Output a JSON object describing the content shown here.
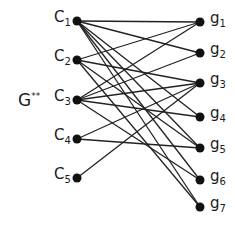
{
  "graph": {
    "title": "G",
    "title_superscript": "**",
    "left_nodes": [
      {
        "id": "c1",
        "label": "C",
        "sub": "1",
        "x": 77,
        "y": 21
      },
      {
        "id": "c2",
        "label": "C",
        "sub": "2",
        "x": 77,
        "y": 60
      },
      {
        "id": "c3",
        "label": "C",
        "sub": "3",
        "x": 77,
        "y": 100
      },
      {
        "id": "c4",
        "label": "C",
        "sub": "4",
        "x": 77,
        "y": 139
      },
      {
        "id": "c5",
        "label": "C",
        "sub": "5",
        "x": 77,
        "y": 178
      }
    ],
    "right_nodes": [
      {
        "id": "g1",
        "label": "g",
        "sub": "1",
        "x": 200,
        "y": 22
      },
      {
        "id": "g2",
        "label": "g",
        "sub": "2",
        "x": 200,
        "y": 53
      },
      {
        "id": "g3",
        "label": "g",
        "sub": "3",
        "x": 200,
        "y": 83
      },
      {
        "id": "g4",
        "label": "g",
        "sub": "4",
        "x": 200,
        "y": 117
      },
      {
        "id": "g5",
        "label": "g",
        "sub": "5",
        "x": 200,
        "y": 148
      },
      {
        "id": "g6",
        "label": "g",
        "sub": "6",
        "x": 200,
        "y": 180
      },
      {
        "id": "g7",
        "label": "g",
        "sub": "7",
        "x": 200,
        "y": 207
      }
    ],
    "edges": [
      [
        "c1",
        "g1"
      ],
      [
        "c1",
        "g2"
      ],
      [
        "c1",
        "g5"
      ],
      [
        "c1",
        "g6"
      ],
      [
        "c1",
        "g7"
      ],
      [
        "c1",
        "g4"
      ],
      [
        "c2",
        "g1"
      ],
      [
        "c2",
        "g3"
      ],
      [
        "c2",
        "g5"
      ],
      [
        "c2",
        "g7"
      ],
      [
        "c3",
        "g1"
      ],
      [
        "c3",
        "g2"
      ],
      [
        "c3",
        "g3"
      ],
      [
        "c3",
        "g4"
      ],
      [
        "c3",
        "g6"
      ],
      [
        "c4",
        "g3"
      ],
      [
        "c4",
        "g5"
      ],
      [
        "c5",
        "g3"
      ]
    ],
    "colors": {
      "node": "#111111",
      "edge": "#222222",
      "text": "#1a1a1a"
    }
  }
}
